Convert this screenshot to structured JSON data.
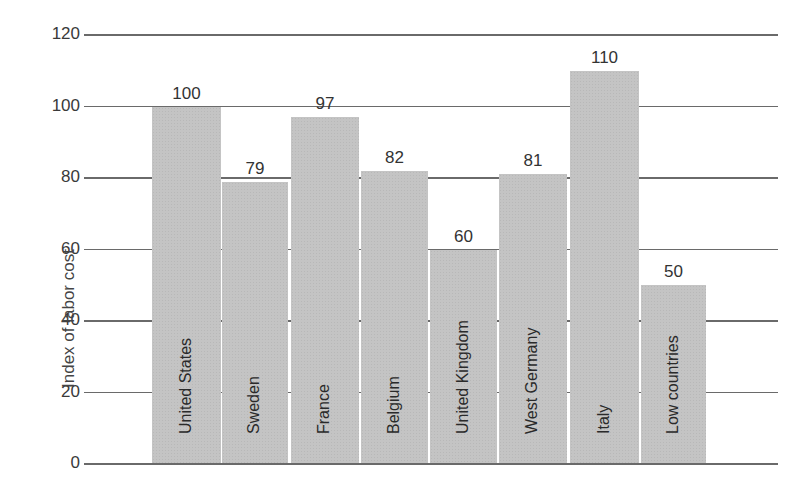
{
  "chart_data": {
    "type": "bar",
    "title": "",
    "xlabel": "",
    "ylabel": "Index of labor cost",
    "ylim": [
      0,
      120
    ],
    "yticks": [
      0,
      20,
      40,
      60,
      80,
      100,
      120
    ],
    "categories": [
      "United States",
      "Sweden",
      "France",
      "Belgium",
      "United Kingdom",
      "West Germany",
      "Italy",
      "Low countries"
    ],
    "values": [
      100,
      79,
      97,
      82,
      60,
      81,
      110,
      50
    ],
    "value_labels": [
      "100",
      "79",
      "97",
      "82",
      "60",
      "81",
      "110",
      "50"
    ],
    "grid": true,
    "legend": null,
    "bar_color": "#c4c4c4"
  },
  "ytick_labels": [
    "0",
    "20",
    "40",
    "60",
    "80",
    "100",
    "120"
  ]
}
